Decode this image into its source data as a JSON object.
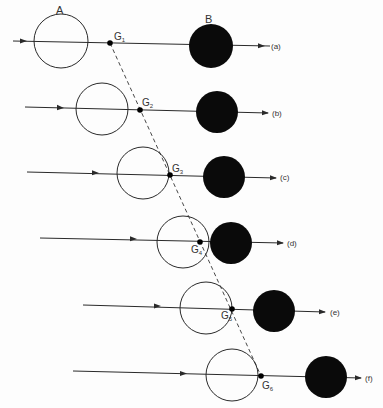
{
  "diagram": {
    "labels": {
      "object_a": "A",
      "object_b": "B"
    },
    "colors": {
      "line": "#2a2a2a",
      "filled": "#0a0a0a",
      "background": "#fdfdfd"
    },
    "rows": [
      {
        "id": "a",
        "tag": "(a)",
        "g_label": "G",
        "g_sub": "1"
      },
      {
        "id": "b",
        "tag": "(b)",
        "g_label": "G",
        "g_sub": "2"
      },
      {
        "id": "c",
        "tag": "(c)",
        "g_label": "G",
        "g_sub": "3"
      },
      {
        "id": "d",
        "tag": "(d)",
        "g_label": "G",
        "g_sub": "4"
      },
      {
        "id": "e",
        "tag": "(e)",
        "g_label": "G",
        "g_sub": "5"
      },
      {
        "id": "f",
        "tag": "(f)",
        "g_label": "G",
        "g_sub": "6"
      }
    ],
    "centre_of_mass_path": "dashed line through G1–G6"
  }
}
